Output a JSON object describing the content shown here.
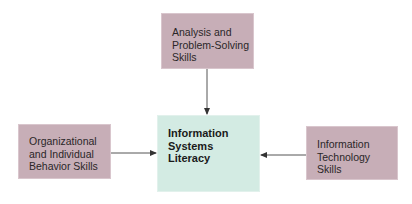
{
  "diagram": {
    "type": "flow",
    "center": {
      "lines": [
        "Information",
        "Systems",
        "Literacy"
      ]
    },
    "top": {
      "lines": [
        "Analysis and",
        "Problem-Solving",
        "Skills"
      ]
    },
    "left": {
      "lines": [
        "Organizational",
        "and Individual",
        "Behavior Skills"
      ]
    },
    "right": {
      "lines": [
        "Information",
        "Technology",
        "Skills"
      ]
    },
    "edges": [
      {
        "from": "top",
        "to": "center"
      },
      {
        "from": "left",
        "to": "center"
      },
      {
        "from": "right",
        "to": "center"
      }
    ],
    "colors": {
      "skill_box": "#c7aeb7",
      "center_box": "#d3ebe3",
      "arrow": "#444444"
    }
  }
}
